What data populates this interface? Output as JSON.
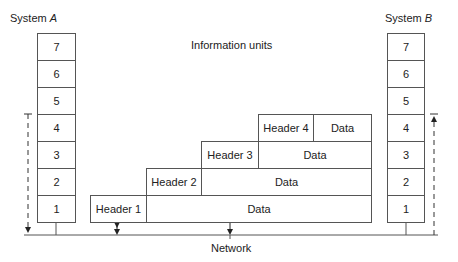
{
  "diagram": {
    "title": "Information units",
    "network_label": "Network",
    "system_a": {
      "label_prefix": "System ",
      "label_var": "A",
      "layers": [
        "7",
        "6",
        "5",
        "4",
        "3",
        "2",
        "1"
      ]
    },
    "system_b": {
      "label_prefix": "System ",
      "label_var": "B",
      "layers": [
        "7",
        "6",
        "5",
        "4",
        "3",
        "2",
        "1"
      ]
    },
    "units": [
      {
        "header": "Header 4",
        "data": "Data"
      },
      {
        "header": "Header 3",
        "data": "Data"
      },
      {
        "header": "Header 2",
        "data": "Data"
      },
      {
        "header": "Header 1",
        "data": "Data"
      }
    ],
    "colors": {
      "line": "#555555",
      "text": "#222222",
      "background": "#ffffff"
    }
  }
}
